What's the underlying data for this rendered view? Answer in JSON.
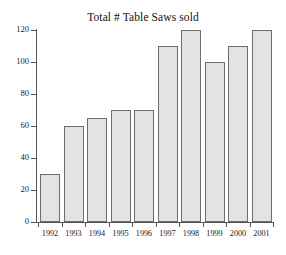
{
  "chart_data": {
    "type": "bar",
    "title": "Total # Table Saws sold",
    "xlabel": "",
    "ylabel": "",
    "categories": [
      "1992",
      "1993",
      "1994",
      "1995",
      "1996",
      "1997",
      "1998",
      "1999",
      "2000",
      "2001"
    ],
    "values": [
      30,
      60,
      65,
      70,
      70,
      110,
      120,
      100,
      110,
      120
    ],
    "ylim": [
      0,
      120
    ],
    "ytick_values": [
      0,
      20,
      40,
      60,
      80,
      100,
      120
    ],
    "ytick_labels": [
      "0",
      "20",
      "40",
      "60",
      "80",
      "100",
      "120"
    ],
    "grid": false,
    "legend": false,
    "legend_position": "none",
    "bar_fill_color": "#e3e3e3",
    "bar_edge_color": "#6d6d6d",
    "axis_color": "#555555",
    "background_color": "#ffffff",
    "text_color": "#222222"
  }
}
